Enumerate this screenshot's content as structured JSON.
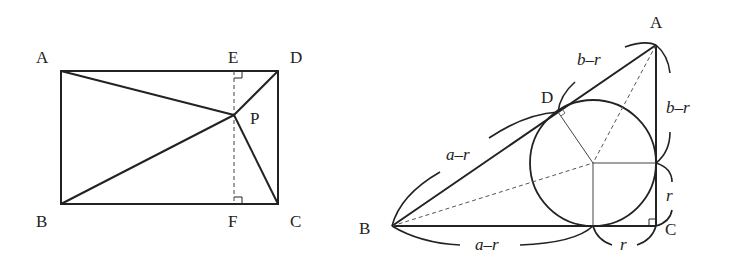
{
  "left_figure": {
    "labels": {
      "A": "A",
      "B": "B",
      "C": "C",
      "D": "D",
      "E": "E",
      "F": "F",
      "P": "P"
    }
  },
  "right_figure": {
    "labels": {
      "A": "A",
      "B": "B",
      "C": "C",
      "D": "D"
    },
    "segment_labels": {
      "AD": "b–r",
      "AE": "b–r",
      "BD": "a–r",
      "BF": "a–r",
      "CE": "r",
      "CF": "r"
    }
  },
  "colors": {
    "line": "#222222",
    "background": "#ffffff"
  }
}
